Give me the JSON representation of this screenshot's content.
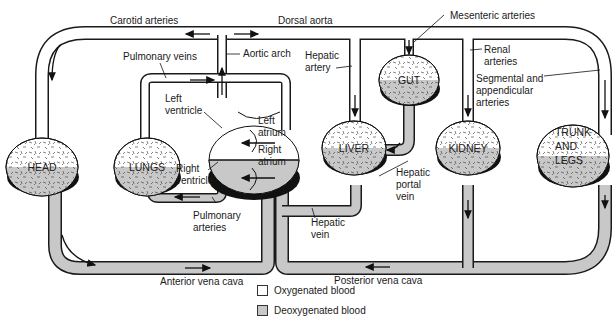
{
  "colors": {
    "oxygenated": "#ffffff",
    "deoxygenated": "#c8c8c8",
    "outline": "#1a1a1a",
    "organ_shadow": "#111111"
  },
  "organs": {
    "head": "HEAD",
    "lungs": "LUNGS",
    "liver": "LIVER",
    "gut": "GUT",
    "kidney": "KIDNEY",
    "trunk_1": "TRUNK",
    "trunk_2": "AND",
    "trunk_3": "LEGS"
  },
  "labels": {
    "carotid_arteries": "Carotid arteries",
    "dorsal_aorta": "Dorsal aorta",
    "mesenteric_arteries": "Mesenteric arteries",
    "pulmonary_veins": "Pulmonary veins",
    "aortic_arch": "Aortic arch",
    "hepatic_artery_1": "Hepatic",
    "hepatic_artery_2": "artery",
    "renal_arteries_1": "Renal",
    "renal_arteries_2": "arteries",
    "segmental_1": "Segmental and",
    "segmental_2": "appendicular",
    "segmental_3": "arteries",
    "left_ventricle_1": "Left",
    "left_ventricle_2": "ventricle",
    "left_atrium_1": "Left",
    "left_atrium_2": "atrium",
    "right_atrium_1": "Right",
    "right_atrium_2": "atrium",
    "right_ventricle_1": "Right",
    "right_ventricle_2": "ventricle",
    "pulmonary_arteries_1": "Pulmonary",
    "pulmonary_arteries_2": "arteries",
    "hepatic_portal_1": "Hepatic",
    "hepatic_portal_2": "portal",
    "hepatic_portal_3": "vein",
    "hepatic_vein_1": "Hepatic",
    "hepatic_vein_2": "vein",
    "anterior_vena_cava": "Anterior vena cava",
    "posterior_vena_cava": "Posterior vena cava"
  },
  "legend": {
    "oxygenated": "Oxygenated blood",
    "deoxygenated": "Deoxygenated blood"
  }
}
